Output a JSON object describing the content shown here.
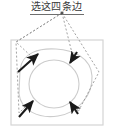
{
  "figure": {
    "title": "选这四条边",
    "title_has_underline": true,
    "colors": {
      "title_text": "#3a3a3a",
      "frame_border": "#d4d4d4",
      "shape_outline": "#cccccc",
      "arrow": "#1a1a1a",
      "dashed_leader": "#8c8c8c",
      "background": "#ffffff"
    },
    "frame": {
      "name": "outer-rectangle",
      "x": 11,
      "y": 40,
      "width": 92,
      "height": 85
    },
    "inner_circle": {
      "name": "inner-circle",
      "cx": 54,
      "cy": 84,
      "rx": 25,
      "ry": 24
    },
    "outer_shape": {
      "name": "outer-rounded-shape",
      "cx": 55,
      "cy": 84,
      "rx": 37,
      "ry": 34
    },
    "leader_origin": {
      "name": "leader-convergence-point",
      "x": 62,
      "y": 13
    },
    "arrows": [
      {
        "id": "arrow-top-left",
        "label": "top-left edge arrow",
        "tail": {
          "x": 18,
          "y": 72
        },
        "head": {
          "x": 38,
          "y": 54
        },
        "direction": "up-right"
      },
      {
        "id": "arrow-top-right",
        "label": "top-right edge arrow",
        "tail": {
          "x": 77,
          "y": 52
        },
        "head": {
          "x": 70,
          "y": 63
        },
        "direction": "down-left"
      },
      {
        "id": "arrow-bottom-left",
        "label": "bottom-left edge arrow",
        "tail": {
          "x": 19,
          "y": 117
        },
        "head": {
          "x": 33,
          "y": 101
        },
        "direction": "up-right"
      },
      {
        "id": "arrow-bottom-right",
        "label": "bottom-right edge arrow",
        "tail": {
          "x": 78,
          "y": 114
        },
        "head": {
          "x": 70,
          "y": 102
        },
        "direction": "up-left"
      }
    ],
    "leaders": [
      {
        "id": "leader-to-top-left",
        "to": {
          "x": 32,
          "y": 56
        }
      },
      {
        "id": "leader-to-top-right",
        "to": {
          "x": 73,
          "y": 57
        }
      },
      {
        "id": "leader-to-bottom-left",
        "to": {
          "x": 28,
          "y": 104
        }
      },
      {
        "id": "leader-to-bottom-right",
        "to": {
          "x": 76,
          "y": 106
        }
      }
    ]
  }
}
